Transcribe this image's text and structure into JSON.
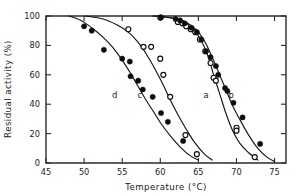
{
  "figure": {
    "background_color": "#ffffff",
    "foreground_color": "#1a1a1a",
    "width": 308,
    "height": 196
  },
  "chart_data": {
    "type": "scatter",
    "title": "",
    "subtitle": "",
    "xlabel": "Temperature  (°C)",
    "ylabel": "Residual activity  (%)",
    "xlim": [
      45,
      76.5
    ],
    "ylim": [
      0,
      100
    ],
    "xticks": [
      45,
      50,
      55,
      60,
      65,
      70,
      75
    ],
    "xticklabels": [
      "45",
      "50",
      "55",
      "60",
      "65",
      "70",
      "75"
    ],
    "yticks": [
      0,
      20,
      40,
      60,
      80,
      100
    ],
    "yticklabels": [
      "0",
      "20",
      "40",
      "60",
      "80",
      "100"
    ],
    "grid": false,
    "legend": "inline-curve-labels",
    "annotations": [
      {
        "text": "a",
        "x": 66.0,
        "y": 44
      },
      {
        "text": "b",
        "x": 69.3,
        "y": 44
      },
      {
        "text": "c",
        "x": 57.3,
        "y": 44
      },
      {
        "text": "d",
        "x": 54.0,
        "y": 44
      }
    ],
    "series": [
      {
        "name": "a",
        "label": "a",
        "marker": "open-circle",
        "marker_color": "#ffffff",
        "edge_color": "#0d0d0d",
        "points": [
          {
            "x": 60.0,
            "y": 99
          },
          {
            "x": 62.3,
            "y": 96
          },
          {
            "x": 62.9,
            "y": 95
          },
          {
            "x": 63.4,
            "y": 93
          },
          {
            "x": 64.0,
            "y": 91
          },
          {
            "x": 64.6,
            "y": 89
          },
          {
            "x": 65.2,
            "y": 84
          },
          {
            "x": 65.9,
            "y": 76
          },
          {
            "x": 66.6,
            "y": 68
          },
          {
            "x": 67.0,
            "y": 58
          },
          {
            "x": 67.3,
            "y": 56
          },
          {
            "x": 70.0,
            "y": 24
          },
          {
            "x": 70.0,
            "y": 22
          },
          {
            "x": 72.4,
            "y": 4
          }
        ]
      },
      {
        "name": "b",
        "label": "b",
        "marker": "filled-circle",
        "marker_color": "#0d0d0d",
        "edge_color": "#0d0d0d",
        "points": [
          {
            "x": 60.1,
            "y": 99
          },
          {
            "x": 62.0,
            "y": 98
          },
          {
            "x": 62.6,
            "y": 97
          },
          {
            "x": 63.2,
            "y": 95
          },
          {
            "x": 64.1,
            "y": 92
          },
          {
            "x": 64.8,
            "y": 89
          },
          {
            "x": 65.4,
            "y": 84
          },
          {
            "x": 66.0,
            "y": 76
          },
          {
            "x": 66.6,
            "y": 72
          },
          {
            "x": 67.3,
            "y": 66
          },
          {
            "x": 67.6,
            "y": 60
          },
          {
            "x": 68.5,
            "y": 51
          },
          {
            "x": 68.8,
            "y": 49
          },
          {
            "x": 69.6,
            "y": 41
          },
          {
            "x": 70.8,
            "y": 31
          },
          {
            "x": 73.1,
            "y": 13
          }
        ]
      },
      {
        "name": "c",
        "label": "c",
        "marker": "open-circle",
        "marker_color": "#ffffff",
        "edge_color": "#0d0d0d",
        "points": [
          {
            "x": 55.8,
            "y": 91
          },
          {
            "x": 57.8,
            "y": 79
          },
          {
            "x": 58.8,
            "y": 79
          },
          {
            "x": 60.0,
            "y": 71
          },
          {
            "x": 60.4,
            "y": 60
          },
          {
            "x": 61.3,
            "y": 45
          },
          {
            "x": 63.3,
            "y": 19
          },
          {
            "x": 64.8,
            "y": 6
          }
        ]
      },
      {
        "name": "d",
        "label": "d",
        "marker": "filled-circle",
        "marker_color": "#0d0d0d",
        "edge_color": "#0d0d0d",
        "points": [
          {
            "x": 50.0,
            "y": 93
          },
          {
            "x": 51.0,
            "y": 90
          },
          {
            "x": 52.6,
            "y": 77
          },
          {
            "x": 55.0,
            "y": 71
          },
          {
            "x": 56.0,
            "y": 69
          },
          {
            "x": 56.1,
            "y": 59
          },
          {
            "x": 57.1,
            "y": 56
          },
          {
            "x": 57.7,
            "y": 50
          },
          {
            "x": 59.0,
            "y": 45
          },
          {
            "x": 60.1,
            "y": 34
          },
          {
            "x": 61.0,
            "y": 28
          },
          {
            "x": 63.0,
            "y": 15
          }
        ]
      }
    ],
    "fit_curves": [
      {
        "name": "a-fit",
        "for_series": "a",
        "points": [
          {
            "x": 59.0,
            "y": 100
          },
          {
            "x": 61.0,
            "y": 99
          },
          {
            "x": 62.5,
            "y": 97
          },
          {
            "x": 63.5,
            "y": 94
          },
          {
            "x": 64.5,
            "y": 90
          },
          {
            "x": 65.5,
            "y": 82
          },
          {
            "x": 66.3,
            "y": 72
          },
          {
            "x": 67.0,
            "y": 60
          },
          {
            "x": 67.8,
            "y": 47
          },
          {
            "x": 68.6,
            "y": 34
          },
          {
            "x": 69.5,
            "y": 22
          },
          {
            "x": 70.5,
            "y": 13
          },
          {
            "x": 71.6,
            "y": 7
          },
          {
            "x": 72.8,
            "y": 2
          }
        ]
      },
      {
        "name": "b-fit",
        "for_series": "b",
        "points": [
          {
            "x": 59.2,
            "y": 100
          },
          {
            "x": 61.3,
            "y": 99
          },
          {
            "x": 62.8,
            "y": 97
          },
          {
            "x": 63.9,
            "y": 94
          },
          {
            "x": 65.0,
            "y": 89
          },
          {
            "x": 66.0,
            "y": 81
          },
          {
            "x": 66.9,
            "y": 71
          },
          {
            "x": 67.7,
            "y": 61
          },
          {
            "x": 68.6,
            "y": 50
          },
          {
            "x": 69.5,
            "y": 39
          },
          {
            "x": 70.5,
            "y": 29
          },
          {
            "x": 71.6,
            "y": 19
          },
          {
            "x": 72.8,
            "y": 10
          },
          {
            "x": 74.0,
            "y": 4
          },
          {
            "x": 75.0,
            "y": 1
          }
        ]
      },
      {
        "name": "c-fit",
        "for_series": "c",
        "points": [
          {
            "x": 50.2,
            "y": 100
          },
          {
            "x": 52.5,
            "y": 98
          },
          {
            "x": 54.3,
            "y": 94
          },
          {
            "x": 55.8,
            "y": 89
          },
          {
            "x": 57.1,
            "y": 82
          },
          {
            "x": 58.3,
            "y": 73
          },
          {
            "x": 59.3,
            "y": 64
          },
          {
            "x": 60.3,
            "y": 54
          },
          {
            "x": 61.3,
            "y": 43
          },
          {
            "x": 62.3,
            "y": 33
          },
          {
            "x": 63.4,
            "y": 23
          },
          {
            "x": 64.5,
            "y": 14
          },
          {
            "x": 65.8,
            "y": 6
          },
          {
            "x": 66.8,
            "y": 2
          }
        ]
      },
      {
        "name": "d-fit",
        "for_series": "d",
        "points": [
          {
            "x": 48.0,
            "y": 100
          },
          {
            "x": 49.6,
            "y": 97
          },
          {
            "x": 51.0,
            "y": 92
          },
          {
            "x": 52.4,
            "y": 86
          },
          {
            "x": 53.7,
            "y": 79
          },
          {
            "x": 55.0,
            "y": 70
          },
          {
            "x": 56.1,
            "y": 61
          },
          {
            "x": 57.1,
            "y": 52
          },
          {
            "x": 58.1,
            "y": 43
          },
          {
            "x": 59.1,
            "y": 35
          },
          {
            "x": 60.2,
            "y": 26
          },
          {
            "x": 61.4,
            "y": 18
          },
          {
            "x": 62.6,
            "y": 11
          },
          {
            "x": 63.9,
            "y": 5
          },
          {
            "x": 65.0,
            "y": 2
          }
        ]
      }
    ]
  }
}
